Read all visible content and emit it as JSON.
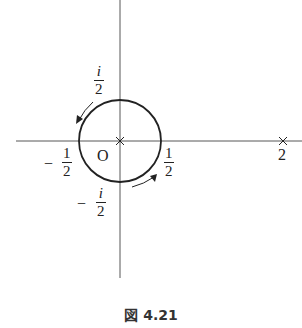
{
  "figure": {
    "caption": "図 4.21",
    "origin_label": "O",
    "labels": {
      "i_half": {
        "num": "i",
        "den": "2"
      },
      "neg_i_half": {
        "sign": "−",
        "num": "i",
        "den": "2"
      },
      "half": {
        "num": "1",
        "den": "2"
      },
      "neg_half": {
        "sign": "−",
        "num": "1",
        "den": "2"
      },
      "two": "2"
    },
    "contour": {
      "type": "circle",
      "center": "0",
      "radius": "1/2",
      "orientation": "counterclockwise"
    },
    "poles": [
      "0",
      "2"
    ]
  }
}
